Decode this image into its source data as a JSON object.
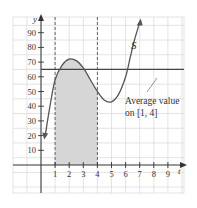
{
  "chart_data": {
    "type": "line",
    "title": "",
    "xlabel": "t",
    "ylabel": "y",
    "xlim": [
      -2,
      10
    ],
    "ylim": [
      -10,
      100
    ],
    "grid": true,
    "x_ticks": [
      1,
      2,
      3,
      4,
      5,
      6,
      7,
      8,
      9
    ],
    "y_ticks": [
      10,
      20,
      30,
      40,
      50,
      60,
      70,
      80,
      90
    ],
    "series": [
      {
        "name": "S",
        "x": [
          0.3,
          0.6,
          1.0,
          1.5,
          2.0,
          2.5,
          3.0,
          3.5,
          4.0,
          4.5,
          5.0,
          5.5,
          6.0,
          6.3,
          6.6,
          7.0
        ],
        "values": [
          20,
          38,
          58,
          68,
          72,
          71,
          66,
          58,
          50,
          44,
          43,
          48,
          60,
          72,
          84,
          97
        ]
      }
    ],
    "reference_lines": [
      {
        "type": "horizontal",
        "y": 65,
        "label": "Average value on [1, 4]"
      },
      {
        "type": "vertical",
        "x": 1,
        "style": "dashed"
      },
      {
        "type": "vertical",
        "x": 4,
        "style": "dashed"
      }
    ],
    "shaded_region": {
      "x_from": 1,
      "x_to": 4,
      "under": "S"
    },
    "annotations": [
      {
        "text": "S",
        "x": 6.2,
        "y": 82
      },
      {
        "text": "Average value",
        "x": 7,
        "y": 45
      },
      {
        "text": "on [1, 4]",
        "x": 7,
        "y": 38
      }
    ],
    "legend": null
  },
  "labels": {
    "y_axis": "y",
    "x_axis": "t",
    "curve": "S",
    "annotation_line1": "Average value",
    "annotation_line2": "on [1, 4]",
    "x_tick_labels": [
      "1",
      "2",
      "3",
      "4",
      "5",
      "6",
      "7",
      "8",
      "9"
    ],
    "y_tick_labels": [
      "10",
      "20",
      "30",
      "40",
      "50",
      "60",
      "70",
      "80",
      "90"
    ]
  },
  "colors": {
    "grid": "#d9d9d9",
    "axis": "#333333",
    "curve": "#555555",
    "shade": "#d6d6d6",
    "average_line": "#444444"
  }
}
